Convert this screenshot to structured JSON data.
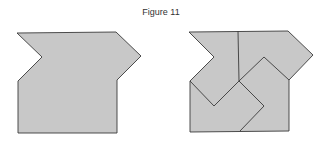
{
  "figure": {
    "title": "Figure 11",
    "colors": {
      "fill": "#c8c8c8",
      "stroke": "#3a3a3a",
      "background": "#ffffff"
    },
    "left_shape": {
      "description": "Single solid polygon",
      "points": "17,33 116,32 141,56 117,80 117,133 18,133 18,81 42,57"
    },
    "right_shape": {
      "description": "Same polygon dissected into four congruent pieces",
      "outline": "189,32 288,31 313,55 289,80 289,131 190,132 190,81 214,57",
      "dissection_lines": [
        "238,31 239,81",
        "190,81 214,106 239,81",
        "239,81 264,57 289,80",
        "239,81 264,106 240,131"
      ]
    }
  }
}
